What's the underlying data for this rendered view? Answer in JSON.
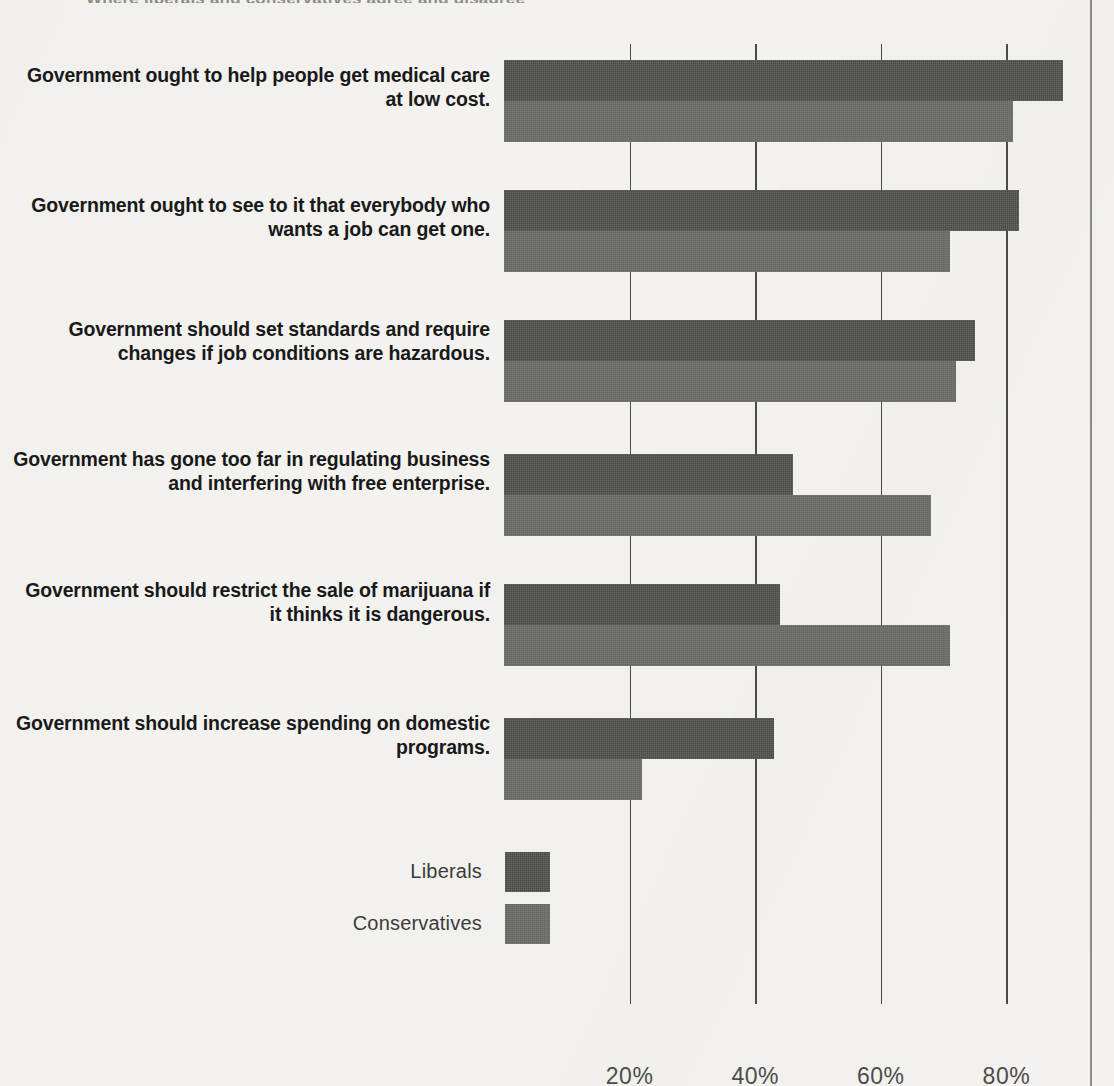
{
  "page": {
    "clipped_title": "Where liberals and conservatives agree and disagree"
  },
  "legend": {
    "items": [
      {
        "label": "Liberals",
        "color": "#4a4a48",
        "swatch": "legend-swatch-liberals"
      },
      {
        "label": "Conservatives",
        "color": "#676765",
        "swatch": "legend-swatch-conservatives"
      }
    ]
  },
  "axis": {
    "ticks": [
      {
        "label": "20%",
        "value": 20
      },
      {
        "label": "40%",
        "value": 40
      },
      {
        "label": "60%",
        "value": 60
      },
      {
        "label": "80%",
        "value": 80
      }
    ]
  },
  "chart_data": {
    "type": "bar",
    "orientation": "horizontal",
    "title": "Where liberals and conservatives agree and disagree",
    "xlabel": "",
    "ylabel": "",
    "xlim": [
      0,
      93
    ],
    "grid": true,
    "gridlines_at": [
      20,
      40,
      60,
      80
    ],
    "legend_position": "bottom-left",
    "categories": [
      "Government ought to help people get medical care at low cost.",
      "Government ought to see to it that everybody who wants a job can get one.",
      "Government should set standards and require changes if job conditions are hazardous.",
      "Government has gone too far in regulating business and interfering with free enterprise.",
      "Government should restrict the sale of marijuana if it thinks it is dangerous.",
      "Government should increase spending on domestic programs."
    ],
    "series": [
      {
        "name": "Liberals",
        "color": "#4a4a48",
        "values": [
          89,
          82,
          75,
          46,
          44,
          43
        ]
      },
      {
        "name": "Conservatives",
        "color": "#676765",
        "values": [
          81,
          71,
          72,
          68,
          71,
          22
        ]
      }
    ]
  }
}
